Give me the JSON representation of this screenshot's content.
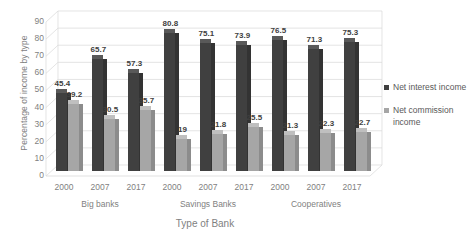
{
  "chart_data": {
    "type": "bar",
    "title": "",
    "xlabel": "Type of Bank",
    "ylabel": "Percentage of income by type",
    "ylim": [
      0,
      90
    ],
    "ytick_labels": [
      "0",
      "10",
      "20",
      "30",
      "40",
      "50",
      "60",
      "70",
      "80",
      "90"
    ],
    "grid": true,
    "legend_position": "right",
    "categories": [
      "2000",
      "2007",
      "2017",
      "2000",
      "2007",
      "2017",
      "2000",
      "2007",
      "2017"
    ],
    "groups": [
      {
        "label": "Big banks",
        "years": [
          "2000",
          "2007",
          "2017"
        ]
      },
      {
        "label": "Savings Banks",
        "years": [
          "2000",
          "2007",
          "2017"
        ]
      },
      {
        "label": "Cooperatives",
        "years": [
          "2000",
          "2007",
          "2017"
        ]
      }
    ],
    "series": [
      {
        "name": "Net interest income",
        "color": "#404040",
        "values": [
          45.4,
          65.7,
          57.3,
          80.8,
          75.1,
          73.9,
          76.5,
          71.3,
          75.3
        ],
        "labels": [
          "45.4",
          "65.7",
          "57.3",
          "80.8",
          "75.1",
          "73.9",
          "76.5",
          "71.3",
          "75.3"
        ]
      },
      {
        "name": "Net commission income",
        "color": "#a6a6a6",
        "values": [
          39.2,
          30.5,
          35.7,
          19,
          21.8,
          25.5,
          21.3,
          22.3,
          22.7
        ],
        "labels": [
          "39.2",
          "30.5",
          "35.7",
          "19",
          "21.8",
          "25.5",
          "21.3",
          "22.3",
          "22.7"
        ]
      }
    ]
  },
  "legend": {
    "items": [
      {
        "label": "Net interest income",
        "color": "#404040"
      },
      {
        "label": "Net commission income",
        "color": "#a6a6a6"
      }
    ]
  },
  "colors": {
    "series_1": "#404040",
    "series_2": "#a6a6a6",
    "grid": "#d9d9d9",
    "text": "#7f7f7f",
    "label_text": "#404040",
    "background": "#ffffff"
  }
}
